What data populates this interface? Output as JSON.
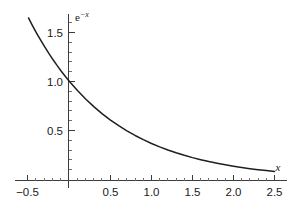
{
  "chart_data": {
    "type": "line",
    "title": "",
    "subtitle": "",
    "xlabel": "x",
    "ylabel": "e^-x",
    "ylabel_base": "e",
    "ylabel_exponent": "−x",
    "function": "e^(-x)",
    "xlim": [
      -0.5,
      2.5
    ],
    "ylim": [
      0.0,
      1.75
    ],
    "grid": false,
    "legend": null,
    "x_ticks_major": [
      -0.5,
      0.5,
      1.0,
      1.5,
      2.0,
      2.5
    ],
    "x_tick_labels": [
      "−0.5",
      "0.5",
      "1.0",
      "1.5",
      "2.0",
      "2.5"
    ],
    "x_ticks_minor": [
      -0.4,
      -0.3,
      -0.2,
      -0.1,
      0.1,
      0.2,
      0.3,
      0.4,
      0.6,
      0.7,
      0.8,
      0.9,
      1.1,
      1.2,
      1.3,
      1.4,
      1.6,
      1.7,
      1.8,
      1.9,
      2.1,
      2.2,
      2.3,
      2.4
    ],
    "y_ticks_major": [
      0.5,
      1.0,
      1.5
    ],
    "y_tick_labels": [
      "0.5",
      "1.0",
      "1.5"
    ],
    "y_ticks_minor": [
      0.1,
      0.2,
      0.3,
      0.4,
      0.6,
      0.7,
      0.8,
      0.9,
      1.1,
      1.2,
      1.3,
      1.4,
      1.6,
      1.7
    ],
    "x": [
      -0.5,
      -0.45,
      -0.4,
      -0.35,
      -0.3,
      -0.25,
      -0.2,
      -0.15,
      -0.1,
      -0.05,
      0.0,
      0.1,
      0.2,
      0.3,
      0.4,
      0.5,
      0.6,
      0.7,
      0.8,
      0.9,
      1.0,
      1.1,
      1.2,
      1.3,
      1.4,
      1.5,
      1.6,
      1.7,
      1.8,
      1.9,
      2.0,
      2.1,
      2.2,
      2.3,
      2.4,
      2.5
    ],
    "y": [
      1.6487,
      1.5683,
      1.4918,
      1.4191,
      1.3499,
      1.284,
      1.2214,
      1.1618,
      1.1052,
      1.0513,
      1.0,
      0.9048,
      0.8187,
      0.7408,
      0.6703,
      0.6065,
      0.5488,
      0.4966,
      0.4493,
      0.4066,
      0.3679,
      0.3329,
      0.3012,
      0.2725,
      0.2466,
      0.2231,
      0.2019,
      0.1827,
      0.1653,
      0.1496,
      0.1353,
      0.1225,
      0.1108,
      0.1003,
      0.0907,
      0.0821
    ],
    "curve_color": "#1f1f1f",
    "axis_color": "#3c3c3c",
    "background_color": "#ffffff"
  }
}
